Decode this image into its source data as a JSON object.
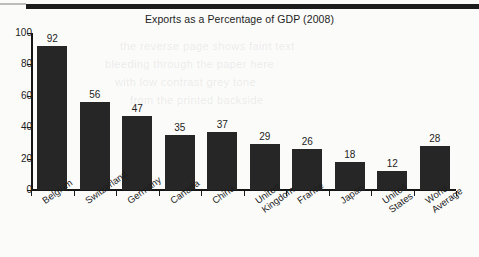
{
  "chart_data": {
    "type": "bar",
    "title": "Exports as a Percentage of GDP (2008)",
    "xlabel": "",
    "ylabel": "",
    "categories": [
      "Belgium",
      "Switzerland",
      "Germany",
      "Canada",
      "China",
      "United\nKingdom",
      "France",
      "Japan",
      "United\nStates",
      "World\nAverage"
    ],
    "values": [
      92,
      56,
      47,
      35,
      37,
      29,
      26,
      18,
      12,
      28
    ],
    "ylim": [
      0,
      100
    ],
    "yticks": [
      0,
      20,
      40,
      60,
      80,
      100
    ],
    "ytick_labels": [
      "0",
      "20",
      "40",
      "60",
      "80",
      "100"
    ],
    "grid": false,
    "legend": null,
    "bar_color": "#262626",
    "axis_color": "#151515",
    "text_color": "#1d1d1d",
    "background_color": "#fbfbfa"
  },
  "artifacts": {
    "top_band_label": "scan-edge-band"
  }
}
